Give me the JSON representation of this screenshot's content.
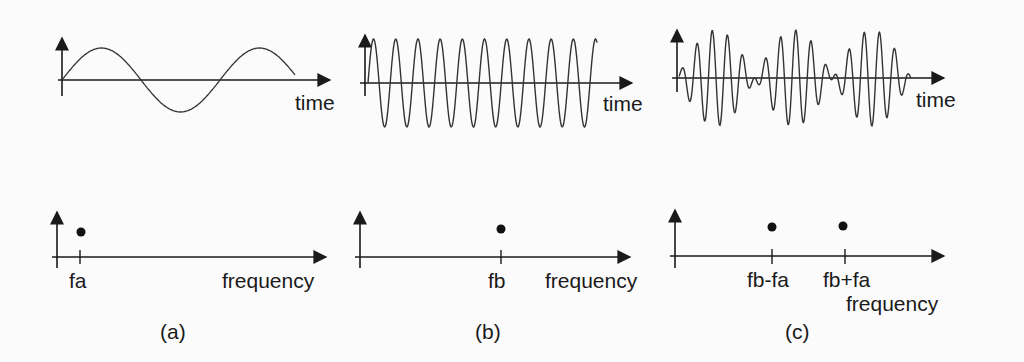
{
  "figure": {
    "panels": [
      {
        "id": "a",
        "caption": "(a)",
        "time_plot": {
          "x_label": "time",
          "signal": "sine, low frequency fa (~1.5 cycles)"
        },
        "freq_plot": {
          "x_label": "frequency",
          "ticks": [
            {
              "label": "fa"
            }
          ],
          "dots": 1
        }
      },
      {
        "id": "b",
        "caption": "(b)",
        "time_plot": {
          "x_label": "time",
          "signal": "sine, high frequency fb (~10 cycles)"
        },
        "freq_plot": {
          "x_label": "frequency",
          "ticks": [
            {
              "label": "fb"
            }
          ],
          "dots": 1
        }
      },
      {
        "id": "c",
        "caption": "(c)",
        "time_plot": {
          "x_label": "time",
          "signal": "product of (a) and (b): amplitude-modulated beat pattern"
        },
        "freq_plot": {
          "x_label": "frequency",
          "ticks": [
            {
              "label": "fb-fa"
            },
            {
              "label": "fb+fa"
            }
          ],
          "dots": 2
        }
      }
    ],
    "colors": {
      "ink": "#1a1a1a",
      "background": "#fbfbfb"
    }
  }
}
